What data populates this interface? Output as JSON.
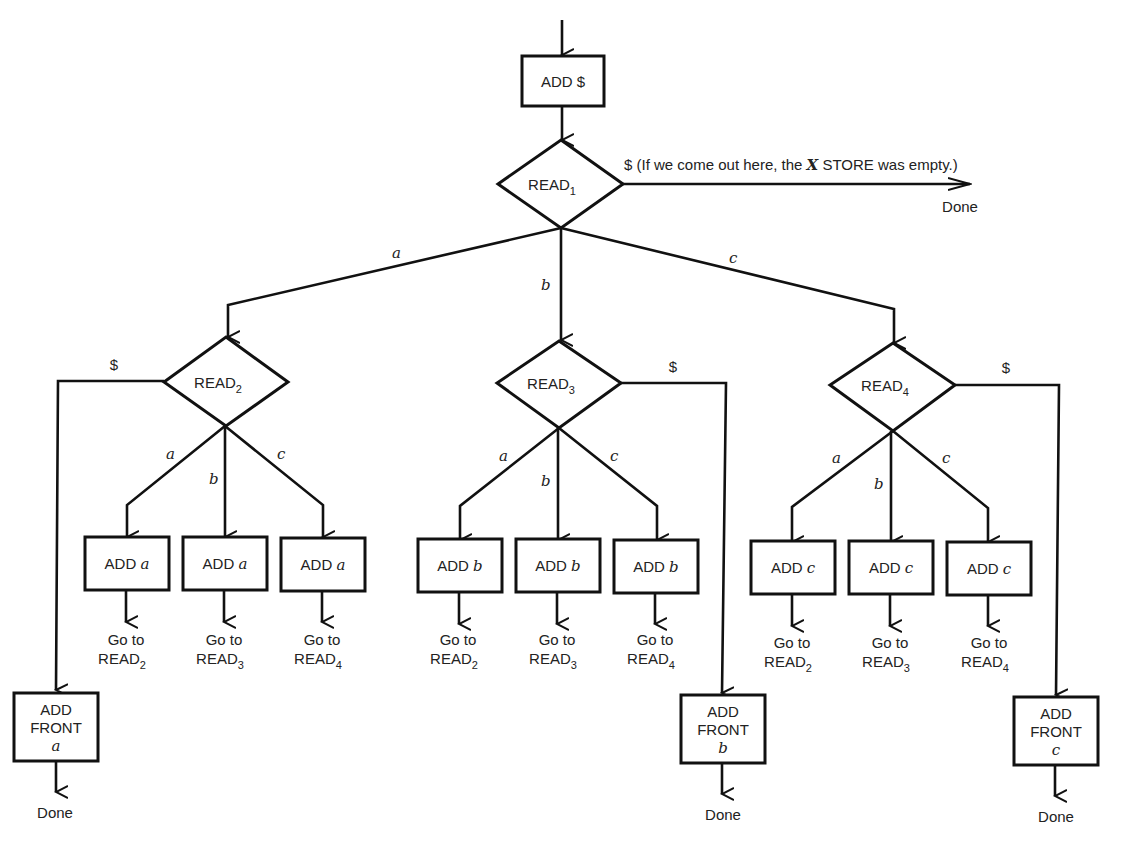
{
  "diagram": {
    "start": {
      "label": "ADD $"
    },
    "read1": {
      "name": "READ",
      "sub": "1",
      "dollar_exit": {
        "symbol": "$",
        "note_pre": " (If we come out here, the ",
        "note_var": "X",
        "note_post": " STORE was empty.)",
        "target": "Done"
      },
      "branches": {
        "a": "a",
        "b": "b",
        "c": "c"
      }
    },
    "read2": {
      "name": "READ",
      "sub": "2",
      "dollar_label": "$",
      "branches": {
        "a": "a",
        "b": "b",
        "c": "c"
      },
      "children": [
        {
          "op": "ADD",
          "var": "a",
          "goto_pre": "Go to",
          "goto_name": "READ",
          "goto_sub": "2"
        },
        {
          "op": "ADD",
          "var": "a",
          "goto_pre": "Go to",
          "goto_name": "READ",
          "goto_sub": "3"
        },
        {
          "op": "ADD",
          "var": "a",
          "goto_pre": "Go to",
          "goto_name": "READ",
          "goto_sub": "4"
        }
      ],
      "front": {
        "line1": "ADD",
        "line2": "FRONT",
        "var": "a",
        "target": "Done"
      }
    },
    "read3": {
      "name": "READ",
      "sub": "3",
      "dollar_label": "$",
      "branches": {
        "a": "a",
        "b": "b",
        "c": "c"
      },
      "children": [
        {
          "op": "ADD",
          "var": "b",
          "goto_pre": "Go to",
          "goto_name": "READ",
          "goto_sub": "2"
        },
        {
          "op": "ADD",
          "var": "b",
          "goto_pre": "Go to",
          "goto_name": "READ",
          "goto_sub": "3"
        },
        {
          "op": "ADD",
          "var": "b",
          "goto_pre": "Go to",
          "goto_name": "READ",
          "goto_sub": "4"
        }
      ],
      "front": {
        "line1": "ADD",
        "line2": "FRONT",
        "var": "b",
        "target": "Done"
      }
    },
    "read4": {
      "name": "READ",
      "sub": "4",
      "dollar_label": "$",
      "branches": {
        "a": "a",
        "b": "b",
        "c": "c"
      },
      "children": [
        {
          "op": "ADD",
          "var": "c",
          "goto_pre": "Go to",
          "goto_name": "READ",
          "goto_sub": "2"
        },
        {
          "op": "ADD",
          "var": "c",
          "goto_pre": "Go to",
          "goto_name": "READ",
          "goto_sub": "3"
        },
        {
          "op": "ADD",
          "var": "c",
          "goto_pre": "Go to",
          "goto_name": "READ",
          "goto_sub": "4"
        }
      ],
      "front": {
        "line1": "ADD",
        "line2": "FRONT",
        "var": "c",
        "target": "Done"
      }
    }
  },
  "colors": {
    "ink": "#111111",
    "text": "#222222",
    "background": "#ffffff"
  }
}
